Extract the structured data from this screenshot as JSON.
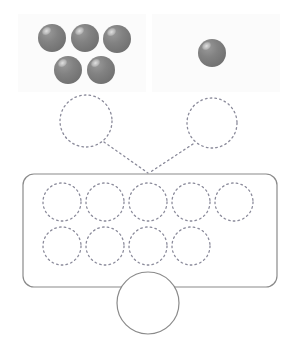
{
  "canvas": {
    "width": 296,
    "height": 344,
    "background": "#ffffff"
  },
  "palette": {
    "sphere_fill": "#7d7d7d",
    "sphere_fill_dark": "#6e6e6e",
    "sphere_highlight": "#d8d8d8",
    "panel_fill": "#fbfbfb",
    "dotted_stroke": "#8a8a9a",
    "solid_stroke": "#8a8a8a",
    "line_stroke": "#8a8a9a"
  },
  "groups": [
    {
      "name": "left-group",
      "panel": {
        "x": 18,
        "y": 14,
        "width": 128,
        "height": 78
      },
      "sphere_count": 5,
      "spheres": [
        {
          "cx": 52,
          "cy": 38,
          "r": 14
        },
        {
          "cx": 85,
          "cy": 38,
          "r": 14
        },
        {
          "cx": 117,
          "cy": 39,
          "r": 14
        },
        {
          "cx": 68,
          "cy": 70,
          "r": 14
        },
        {
          "cx": 101,
          "cy": 70,
          "r": 14
        }
      ],
      "answer_slot": {
        "cx": 86,
        "cy": 121,
        "r": 26,
        "value": ""
      }
    },
    {
      "name": "right-group",
      "panel": {
        "x": 152,
        "y": 14,
        "width": 128,
        "height": 78
      },
      "sphere_count": 1,
      "spheres": [
        {
          "cx": 212,
          "cy": 53,
          "r": 14
        }
      ],
      "answer_slot": {
        "cx": 212,
        "cy": 123,
        "r": 25,
        "value": ""
      }
    }
  ],
  "connectors": [
    {
      "name": "left-connector",
      "x1": 104,
      "y1": 142,
      "x2": 148,
      "y2": 173
    },
    {
      "name": "right-connector",
      "x1": 193,
      "y1": 144,
      "x2": 149,
      "y2": 173
    }
  ],
  "result_box": {
    "name": "result-container",
    "x": 23,
    "y": 174,
    "width": 254,
    "height": 113,
    "radius": 11,
    "slot_rows": [
      {
        "row": 1,
        "cy": 202,
        "r": 19,
        "slots": [
          {
            "cx": 62,
            "value": ""
          },
          {
            "cx": 105,
            "value": ""
          },
          {
            "cx": 148,
            "value": ""
          },
          {
            "cx": 191,
            "value": ""
          },
          {
            "cx": 234,
            "value": ""
          }
        ]
      },
      {
        "row": 2,
        "cy": 246,
        "r": 19,
        "slots": [
          {
            "cx": 62,
            "value": ""
          },
          {
            "cx": 105,
            "value": ""
          },
          {
            "cx": 148,
            "value": ""
          },
          {
            "cx": 191,
            "value": ""
          }
        ]
      }
    ],
    "total_slot": {
      "name": "total-answer-slot",
      "cx": 148,
      "cy": 303,
      "r": 31,
      "value": ""
    }
  },
  "labels": {
    "left_group_count": "5",
    "right_group_count": "1",
    "empty_slot_placeholder": ""
  }
}
